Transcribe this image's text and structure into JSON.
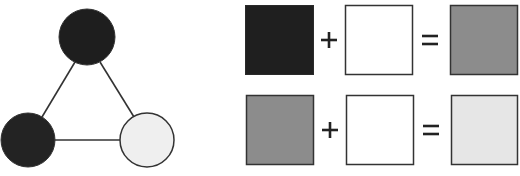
{
  "diagram": {
    "graph": {
      "nodes": [
        {
          "id": "top",
          "fill": "#1e1e1e",
          "cx": 87,
          "cy": 37,
          "r": 28
        },
        {
          "id": "bottom-left",
          "fill": "#232323",
          "cx": 28,
          "cy": 140,
          "r": 27
        },
        {
          "id": "bottom-right",
          "fill": "#efefef",
          "cx": 147,
          "cy": 140,
          "r": 27
        }
      ],
      "edges": [
        [
          "top",
          "bottom-left"
        ],
        [
          "top",
          "bottom-right"
        ],
        [
          "bottom-left",
          "bottom-right"
        ]
      ]
    },
    "equations": [
      {
        "left": "#1f1f1f",
        "operator_plus": "+",
        "middle": "#ffffff",
        "operator_equals": "=",
        "result": "#8c8c8c"
      },
      {
        "left": "#8c8c8c",
        "operator_plus": "+",
        "middle": "#ffffff",
        "operator_equals": "=",
        "result": "#e6e6e6"
      }
    ],
    "stroke_color": "#333333"
  }
}
